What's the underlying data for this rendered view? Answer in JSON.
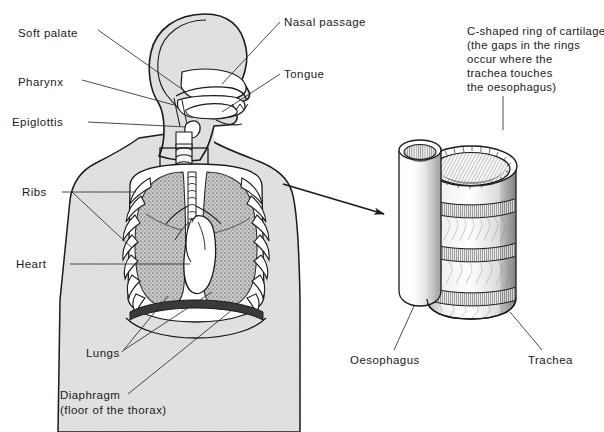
{
  "figure": {
    "background_color": "#ffffff",
    "ink_color": "#1a1a1a",
    "body_fill_color": "#e8e8e8",
    "lung_fill_color": "#a8a8a8",
    "organ_fill_color": "#ffffff"
  },
  "labels": {
    "soft_palate": "Soft palate",
    "pharynx": "Pharynx",
    "epiglottis": "Epiglottis",
    "ribs": "Ribs",
    "heart": "Heart",
    "lungs": "Lungs",
    "diaphragm": "Diaphragm",
    "diaphragm_sub": "(floor of the thorax)",
    "nasal_passage": "Nasal passage",
    "tongue": "Tongue",
    "oesophagus": "Oesophagus",
    "trachea": "Trachea"
  },
  "caption": {
    "line1": "C-shaped ring of cartilage",
    "line2": "(the gaps in the rings",
    "line3": "occur where the",
    "line4": "trachea touches",
    "line5": "the oesophagus)"
  },
  "callout": {
    "description": "arrow from neck trachea box to enlarged trachea detail",
    "source_region": "neck-trachea-box",
    "target_region": "trachea-detail"
  }
}
